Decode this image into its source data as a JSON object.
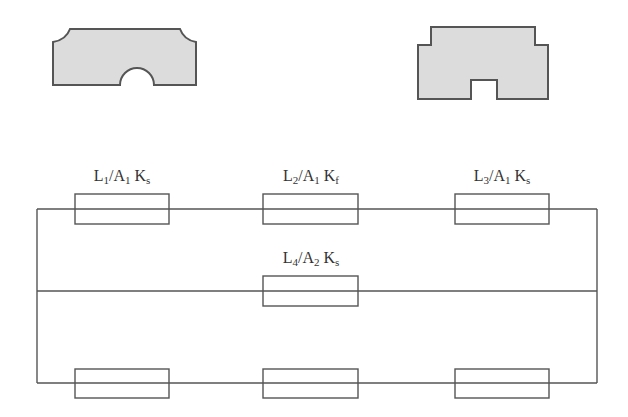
{
  "diagram": {
    "type": "thermal-resistance-network",
    "shapes": [
      {
        "id": "profile-left",
        "description": "plate cross-section with rounded top corners and semicircular bottom notch",
        "fill": "#dcdcdc",
        "stroke": "#555555"
      },
      {
        "id": "profile-right",
        "description": "stepped plate cross-section with rectangular bottom notch",
        "fill": "#dcdcdc",
        "stroke": "#555555"
      }
    ],
    "labels": [
      {
        "id": "r1",
        "L": "L",
        "L_sub": "1",
        "slash": "/",
        "A": "A",
        "A_sub": "1",
        "K": "K",
        "K_sub": "s"
      },
      {
        "id": "r2",
        "L": "L",
        "L_sub": "2",
        "slash": "/",
        "A": "A",
        "A_sub": "1",
        "K": "K",
        "K_sub": "f"
      },
      {
        "id": "r3",
        "L": "L",
        "L_sub": "3",
        "slash": "/",
        "A": "A",
        "A_sub": "1",
        "K": "K",
        "K_sub": "s"
      },
      {
        "id": "r4",
        "L": "L",
        "L_sub": "4",
        "slash": "/",
        "A": "A",
        "A_sub": "2",
        "K": "K",
        "K_sub": "s"
      }
    ],
    "branches": [
      {
        "name": "top",
        "resistors": 3
      },
      {
        "name": "middle",
        "resistors": 1
      },
      {
        "name": "bottom",
        "resistors": 3
      }
    ],
    "colors": {
      "line": "#555555",
      "fill": "#dcdcdc",
      "text": "#333333"
    }
  }
}
